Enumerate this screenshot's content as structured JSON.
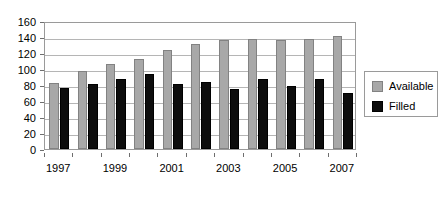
{
  "chart_data": {
    "type": "bar",
    "title": "",
    "xlabel": "",
    "ylabel": "",
    "ylim": [
      0,
      160
    ],
    "ytick_step": 20,
    "yticks": [
      0,
      20,
      40,
      60,
      80,
      100,
      120,
      140,
      160
    ],
    "grid": true,
    "legend_position": "right",
    "categories": [
      1997,
      1998,
      1999,
      2000,
      2001,
      2002,
      2003,
      2004,
      2005,
      2006,
      2007
    ],
    "xtick_labels": [
      "1997",
      "1999",
      "2001",
      "2003",
      "2005",
      "2007"
    ],
    "xtick_categories": [
      1997,
      1999,
      2001,
      2003,
      2005,
      2007
    ],
    "series": [
      {
        "name": "Available",
        "color": "#a8a8a8",
        "values": [
          82,
          97,
          106,
          112,
          124,
          131,
          136,
          137,
          136,
          137,
          141
        ]
      },
      {
        "name": "Filled",
        "color": "#0d0d0d",
        "values": [
          76,
          81,
          88,
          94,
          81,
          84,
          75,
          87,
          79,
          88,
          70
        ]
      }
    ]
  },
  "legend": {
    "entries": [
      {
        "label": "Available",
        "swatch": "available"
      },
      {
        "label": "Filled",
        "swatch": "filled"
      }
    ]
  }
}
